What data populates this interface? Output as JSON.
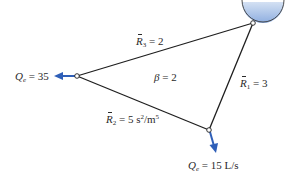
{
  "diagram": {
    "type": "pipe-network",
    "colors": {
      "pipe": "#1e1e1e",
      "arrow": "#2f5fb8",
      "reservoir_top": "#c9d9f0",
      "reservoir_bottom": "#8fb0e0",
      "node_fill": "#ffffff"
    },
    "reservoir": {
      "label": "reservoir"
    },
    "nodes": [
      {
        "id": "top",
        "x": 253,
        "y": 23
      },
      {
        "id": "left",
        "x": 77,
        "y": 76
      },
      {
        "id": "bottom",
        "x": 209,
        "y": 130
      }
    ],
    "pipes": {
      "r1": {
        "symbol": "R",
        "sub": "1",
        "eq": " = 3",
        "units": ""
      },
      "r2": {
        "symbol": "R",
        "sub": "2",
        "eq": " = 5 s",
        "sup1": "2",
        "mid": "/m",
        "sup2": "5"
      },
      "r3": {
        "symbol": "R",
        "sub": "3",
        "eq": " = 2",
        "units": ""
      }
    },
    "beta": {
      "symbol": "β",
      "eq": " = 2"
    },
    "outflows": {
      "left": {
        "symbol": "Q",
        "sub": "e",
        "eq": " = 35"
      },
      "bottom": {
        "symbol": "Q",
        "sub": "e",
        "eq": " = 15 L/s"
      }
    }
  }
}
